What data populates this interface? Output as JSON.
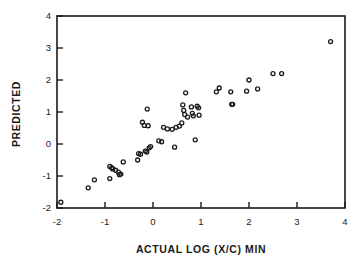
{
  "chart_data": {
    "type": "scatter",
    "title": "",
    "xlabel": "ACTUAL LOG (X/C) MIN",
    "ylabel": "PREDICTED",
    "xlim": [
      -2,
      4
    ],
    "ylim": [
      -2,
      4
    ],
    "xticks": [
      -2,
      -1,
      0,
      1,
      2,
      3,
      4
    ],
    "xtick_labels": [
      "-2",
      "-1",
      "0",
      "1",
      "2",
      "3",
      "4"
    ],
    "yticks": [
      -2,
      -1,
      0,
      1,
      2,
      3,
      4
    ],
    "ytick_labels": [
      "-2",
      "-1",
      "0",
      "1",
      "2",
      "3",
      "4"
    ],
    "grid": false,
    "legend": null,
    "marker": "open-circle",
    "marker_color": "#1a1a1a",
    "marker_size": 4,
    "points": [
      [
        -1.92,
        -1.82
      ],
      [
        -1.35,
        -1.37
      ],
      [
        -1.22,
        -1.12
      ],
      [
        -0.9,
        -1.08
      ],
      [
        -0.9,
        -0.7
      ],
      [
        -0.86,
        -0.74
      ],
      [
        -0.84,
        -0.78
      ],
      [
        -0.78,
        -0.82
      ],
      [
        -0.72,
        -0.88
      ],
      [
        -0.7,
        -0.96
      ],
      [
        -0.67,
        -0.94
      ],
      [
        -0.62,
        -0.56
      ],
      [
        -0.32,
        -0.5
      ],
      [
        -0.3,
        -0.3
      ],
      [
        -0.26,
        -0.32
      ],
      [
        -0.22,
        0.68
      ],
      [
        -0.18,
        0.58
      ],
      [
        -0.16,
        -0.22
      ],
      [
        -0.13,
        -0.25
      ],
      [
        -0.12,
        1.09
      ],
      [
        -0.1,
        0.57
      ],
      [
        -0.08,
        -0.12
      ],
      [
        -0.05,
        -0.08
      ],
      [
        0.12,
        0.1
      ],
      [
        0.18,
        0.07
      ],
      [
        0.22,
        0.52
      ],
      [
        0.3,
        0.47
      ],
      [
        0.4,
        0.46
      ],
      [
        0.45,
        -0.1
      ],
      [
        0.48,
        0.52
      ],
      [
        0.55,
        0.56
      ],
      [
        0.6,
        0.66
      ],
      [
        0.62,
        1.22
      ],
      [
        0.64,
        1.05
      ],
      [
        0.66,
        0.92
      ],
      [
        0.68,
        1.6
      ],
      [
        0.72,
        0.84
      ],
      [
        0.8,
        1.16
      ],
      [
        0.82,
        0.96
      ],
      [
        0.84,
        0.88
      ],
      [
        0.88,
        0.13
      ],
      [
        0.92,
        1.18
      ],
      [
        0.95,
        1.13
      ],
      [
        0.96,
        0.9
      ],
      [
        1.32,
        1.63
      ],
      [
        1.38,
        1.75
      ],
      [
        1.62,
        1.63
      ],
      [
        1.64,
        1.24
      ],
      [
        1.66,
        1.24
      ],
      [
        1.95,
        1.65
      ],
      [
        2.0,
        2.0
      ],
      [
        2.18,
        1.72
      ],
      [
        2.5,
        2.2
      ],
      [
        2.68,
        2.2
      ],
      [
        3.7,
        3.2
      ]
    ]
  }
}
